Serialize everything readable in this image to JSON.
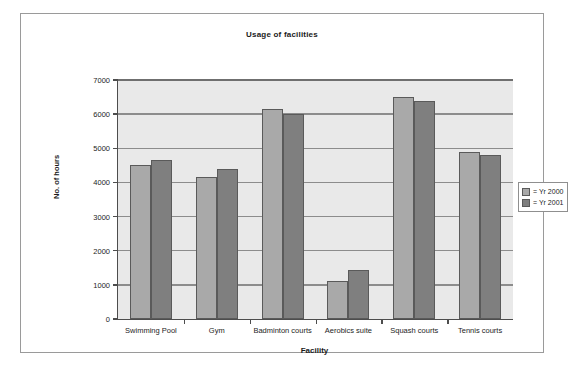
{
  "figure": {
    "title": "Usage of facilities"
  },
  "chart_data": {
    "type": "bar",
    "title": "Usage of facilities",
    "xlabel": "Facility",
    "ylabel": "No. of hours",
    "categories": [
      "Swimming Pool",
      "Gym",
      "Badminton courts",
      "Aerobics suite",
      "Squash courts",
      "Tennis courts"
    ],
    "series": [
      {
        "name": "Yr 2000",
        "color": "#a9a9a9",
        "values": [
          4500,
          4150,
          6150,
          1100,
          6500,
          4900
        ]
      },
      {
        "name": "Yr 2001",
        "color": "#7f7f7f",
        "values": [
          4650,
          4400,
          6000,
          1450,
          6400,
          4800
        ]
      }
    ],
    "ylim": [
      0,
      7000
    ],
    "yticks": [
      0,
      1000,
      2000,
      3000,
      4000,
      5000,
      6000,
      7000
    ],
    "ytick_labels": [
      "0",
      "1000",
      "2000",
      "3000",
      "4000",
      "5000",
      "6000",
      "7000"
    ],
    "grid": true,
    "legend_position": "right",
    "legend_entries": [
      "= Yr 2000",
      "= Yr 2001"
    ]
  }
}
